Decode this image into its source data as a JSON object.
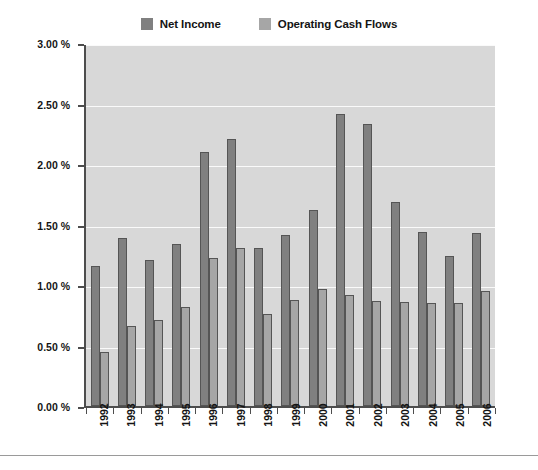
{
  "legend": {
    "position": "top-center",
    "entries": [
      {
        "label": "Net Income",
        "color": "#808080",
        "swatch_name": "legend-swatch-net-income"
      },
      {
        "label": "Operating Cash Flows",
        "color": "#a6a6a6",
        "swatch_name": "legend-swatch-operating-cash-flows"
      }
    ]
  },
  "axes": {
    "y_ticks": [
      "0.00 %",
      "0.50 %",
      "1.00 %",
      "1.50 %",
      "2.00 %",
      "2.50 %",
      "3.00 %"
    ],
    "x_ticks": [
      "1992",
      "1993",
      "1994",
      "1995",
      "1996",
      "1997",
      "1998",
      "1999",
      "2000",
      "2001",
      "2002",
      "2003",
      "2004",
      "2005",
      "2006"
    ]
  },
  "colors": {
    "plot_background": "#d8d8d8",
    "gridline": "#fafafa",
    "axis": "#4d4d4d",
    "net_income": "#808080",
    "operating_cash_flows": "#a6a6a6",
    "bar_outline": "#555555",
    "text": "#141414",
    "page_background": "#ffffff"
  },
  "chart_data": {
    "type": "bar",
    "title": "",
    "subtitle": "",
    "xlabel": "",
    "ylabel": "",
    "ylim": [
      0,
      3
    ],
    "ytick_values": [
      0,
      0.5,
      1,
      1.5,
      2,
      2.5,
      3
    ],
    "ytick_labels": [
      "0.00 %",
      "0.50 %",
      "1.00 %",
      "1.50 %",
      "2.00 %",
      "2.50 %",
      "3.00 %"
    ],
    "unit": "%",
    "grid": true,
    "grid_axis": "y",
    "legend_position": "top-center",
    "categories": [
      "1992",
      "1993",
      "1994",
      "1995",
      "1996",
      "1997",
      "1998",
      "1999",
      "2000",
      "2001",
      "2002",
      "2003",
      "2004",
      "2005",
      "2006"
    ],
    "series": [
      {
        "name": "Net Income",
        "color": "#808080",
        "values": [
          1.16,
          1.39,
          1.21,
          1.34,
          2.1,
          2.21,
          1.31,
          1.41,
          1.62,
          2.41,
          2.33,
          1.69,
          1.44,
          1.24,
          1.43
        ]
      },
      {
        "name": "Operating Cash Flows",
        "color": "#a6a6a6",
        "values": [
          0.45,
          0.66,
          0.71,
          0.82,
          1.22,
          1.31,
          0.76,
          0.88,
          0.97,
          0.92,
          0.87,
          0.86,
          0.85,
          0.85,
          0.95
        ]
      }
    ]
  }
}
